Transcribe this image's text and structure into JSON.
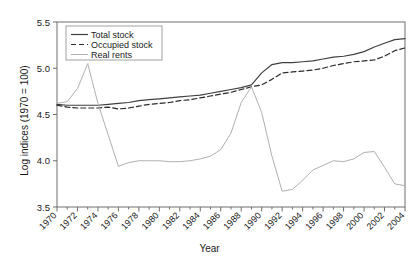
{
  "chart_data": {
    "type": "line",
    "title": "",
    "xlabel": "Year",
    "ylabel": "Log indices (1970 = 100)",
    "xlim": [
      1970,
      2004
    ],
    "ylim": [
      3.5,
      5.5
    ],
    "ytick_values": [
      3.5,
      4.0,
      4.5,
      5.0,
      5.5
    ],
    "ytick_labels": [
      "3.5",
      "4.0",
      "4.5",
      "5.0",
      "5.5"
    ],
    "xtick_labels": [
      "1970",
      "1972",
      "1974",
      "1976",
      "1978",
      "1980",
      "1982",
      "1984",
      "1986",
      "1988",
      "1990",
      "1992",
      "1994",
      "1996",
      "1998",
      "2000",
      "2002",
      "2004"
    ],
    "xtick_label_rotation": -45,
    "minor_xticks_every": 1,
    "grid": false,
    "legend_position": "top-left",
    "x": [
      1970,
      1971,
      1972,
      1973,
      1974,
      1975,
      1976,
      1977,
      1978,
      1979,
      1980,
      1981,
      1982,
      1983,
      1984,
      1985,
      1986,
      1987,
      1988,
      1989,
      1990,
      1991,
      1992,
      1993,
      1994,
      1995,
      1996,
      1997,
      1998,
      1999,
      2000,
      2001,
      2002,
      2003,
      2004
    ],
    "series": [
      {
        "name": "Total stock",
        "style": "solid",
        "color": "#404040",
        "values": [
          4.61,
          4.6,
          4.6,
          4.6,
          4.6,
          4.61,
          4.62,
          4.63,
          4.65,
          4.66,
          4.67,
          4.68,
          4.69,
          4.7,
          4.71,
          4.73,
          4.75,
          4.77,
          4.79,
          4.82,
          4.95,
          5.04,
          5.06,
          5.06,
          5.07,
          5.08,
          5.1,
          5.12,
          5.13,
          5.15,
          5.18,
          5.23,
          5.27,
          5.31,
          5.32
        ]
      },
      {
        "name": "Occupied stock",
        "style": "dashed",
        "color": "#2b2b2b",
        "values": [
          4.6,
          4.58,
          4.57,
          4.57,
          4.57,
          4.58,
          4.56,
          4.57,
          4.59,
          4.61,
          4.62,
          4.63,
          4.65,
          4.66,
          4.68,
          4.7,
          4.72,
          4.74,
          4.77,
          4.8,
          4.82,
          4.88,
          4.95,
          4.96,
          4.97,
          4.98,
          5.0,
          5.03,
          5.05,
          5.07,
          5.08,
          5.09,
          5.13,
          5.19,
          5.22
        ]
      },
      {
        "name": "Real rents",
        "style": "solid",
        "color": "#b0b0b0",
        "values": [
          4.62,
          4.64,
          4.78,
          5.05,
          4.62,
          4.28,
          3.94,
          3.98,
          4.0,
          4.0,
          4.0,
          3.99,
          3.99,
          4.0,
          4.02,
          4.05,
          4.12,
          4.3,
          4.63,
          4.8,
          4.52,
          4.05,
          3.67,
          3.69,
          3.79,
          3.9,
          3.95,
          4.0,
          3.99,
          4.02,
          4.09,
          4.1,
          3.93,
          3.75,
          3.73
        ]
      }
    ]
  }
}
